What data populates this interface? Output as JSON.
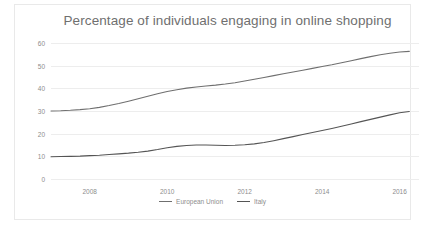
{
  "chart_data": {
    "type": "line",
    "title": "Percentage of individuals engaging in online shopping",
    "xlabel": "",
    "ylabel": "",
    "ylim": [
      0,
      60
    ],
    "xlim": [
      2007.0,
      2016.5
    ],
    "ytick_labels": [
      "0",
      "10",
      "20",
      "30",
      "40",
      "50",
      "60"
    ],
    "ytick_values": [
      0,
      10,
      20,
      30,
      40,
      50,
      60
    ],
    "xtick_labels": [
      "2008",
      "2010",
      "2012",
      "2014",
      "2016"
    ],
    "xtick_values": [
      2008,
      2010,
      2012,
      2014,
      2016
    ],
    "grid": true,
    "legend_position": "bottom-center",
    "x": [
      2007.0,
      2007.25,
      2007.5,
      2007.75,
      2008.0,
      2008.25,
      2008.5,
      2008.75,
      2009.0,
      2009.25,
      2009.5,
      2009.75,
      2010.0,
      2010.25,
      2010.5,
      2010.75,
      2011.0,
      2011.25,
      2011.5,
      2011.75,
      2012.0,
      2012.25,
      2012.5,
      2012.75,
      2013.0,
      2013.25,
      2013.5,
      2013.75,
      2014.0,
      2014.25,
      2014.5,
      2014.75,
      2015.0,
      2015.25,
      2015.5,
      2015.75,
      2016.0,
      2016.25
    ],
    "series": [
      {
        "name": "European Union",
        "color": "#6f6f6f",
        "values": [
          30.0,
          30.1,
          30.3,
          30.6,
          31.0,
          31.6,
          32.4,
          33.3,
          34.3,
          35.4,
          36.5,
          37.6,
          38.6,
          39.4,
          40.1,
          40.6,
          41.0,
          41.4,
          41.9,
          42.5,
          43.2,
          44.0,
          44.8,
          45.6,
          46.4,
          47.2,
          48.0,
          48.8,
          49.6,
          50.4,
          51.3,
          52.2,
          53.1,
          54.0,
          54.8,
          55.5,
          56.0,
          56.3
        ]
      },
      {
        "name": "Italy",
        "color": "#555555",
        "values": [
          9.8,
          9.9,
          10.0,
          10.1,
          10.3,
          10.5,
          10.8,
          11.1,
          11.4,
          11.8,
          12.3,
          13.0,
          13.8,
          14.4,
          14.8,
          15.0,
          15.0,
          14.9,
          14.8,
          14.9,
          15.1,
          15.5,
          16.1,
          16.9,
          17.8,
          18.7,
          19.6,
          20.5,
          21.4,
          22.3,
          23.3,
          24.3,
          25.3,
          26.3,
          27.3,
          28.3,
          29.2,
          29.8
        ]
      }
    ]
  }
}
